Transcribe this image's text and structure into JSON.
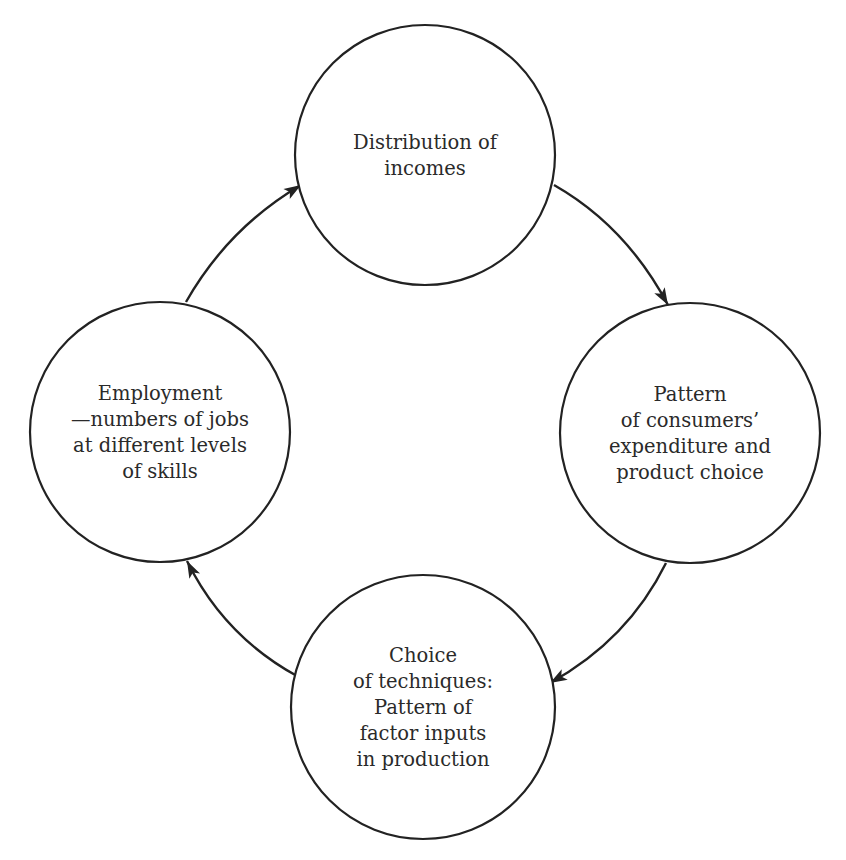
{
  "diagram": {
    "type": "cycle",
    "colors": {
      "stroke": "#222222",
      "text": "#2a2a2a",
      "background": "#ffffff"
    },
    "nodes": [
      {
        "id": "distribution-of-incomes",
        "lines": [
          "Distribution of",
          "incomes"
        ],
        "cx": 425,
        "cy": 155,
        "r": 130
      },
      {
        "id": "consumer-expenditure",
        "lines": [
          "Pattern",
          "of consumers’",
          "expenditure and",
          "product choice"
        ],
        "cx": 690,
        "cy": 433,
        "r": 130
      },
      {
        "id": "choice-of-techniques",
        "lines": [
          "Choice",
          "of techniques:",
          "Pattern of",
          "factor inputs",
          "in production"
        ],
        "cx": 423,
        "cy": 707,
        "r": 132
      },
      {
        "id": "employment",
        "lines": [
          "Employment",
          "—numbers of jobs",
          "at different levels",
          "of skills"
        ],
        "cx": 160,
        "cy": 432,
        "r": 130
      }
    ],
    "edges": [
      {
        "from": "employment",
        "to": "distribution-of-incomes",
        "path": "M 186 302 Q 228 228 301 185",
        "arrow": {
          "x": 301,
          "y": 185,
          "angle": -32
        }
      },
      {
        "from": "distribution-of-incomes",
        "to": "consumer-expenditure",
        "path": "M 554 185 Q 626 226 668 305",
        "arrow": {
          "x": 668,
          "y": 305,
          "angle": 60
        }
      },
      {
        "from": "consumer-expenditure",
        "to": "choice-of-techniques",
        "path": "M 666 563 Q 628 640 550 683",
        "arrow": {
          "x": 550,
          "y": 683,
          "angle": 150
        }
      },
      {
        "from": "choice-of-techniques",
        "to": "employment",
        "path": "M 297 676 Q 224 636 187 561",
        "arrow": {
          "x": 187,
          "y": 561,
          "angle": 243
        }
      }
    ]
  }
}
